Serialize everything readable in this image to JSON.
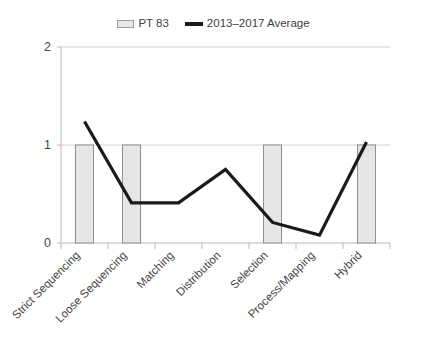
{
  "legend": {
    "position": "top-center",
    "entries": [
      {
        "label": "PT 83",
        "marker": "bar-swatch-icon",
        "color": "#e6e6e6"
      },
      {
        "label": "2013–2017 Average",
        "marker": "line-swatch-icon",
        "color": "#1a1a1a"
      }
    ]
  },
  "axes": {
    "y_ticks": [
      "0",
      "1",
      "2"
    ],
    "x_categories": [
      "Strict Sequencing",
      "Loose Sequencing",
      "Matching",
      "Distribution",
      "Selection",
      "Process/Mapping",
      "Hybrid"
    ]
  },
  "chart_data": {
    "type": "bar",
    "title": "",
    "subtitle": "",
    "xlabel": "",
    "ylabel": "",
    "ylim": [
      0,
      2
    ],
    "yticks": [
      0,
      1,
      2
    ],
    "grid": true,
    "grid_axis": "y",
    "legend_position": "top-center",
    "categories": [
      "Strict Sequencing",
      "Loose Sequencing",
      "Matching",
      "Distribution",
      "Selection",
      "Process/Mapping",
      "Hybrid"
    ],
    "series": [
      {
        "name": "PT 83",
        "type": "bar",
        "color": "#e6e6e6",
        "edge_color": "#8f8f8f",
        "values": [
          1,
          1,
          0,
          0,
          1,
          0,
          1
        ]
      },
      {
        "name": "2013–2017 Average",
        "type": "line",
        "color": "#1a1a1a",
        "values": [
          1.24,
          0.41,
          0.41,
          0.75,
          0.21,
          0.08,
          1.03
        ]
      }
    ]
  }
}
